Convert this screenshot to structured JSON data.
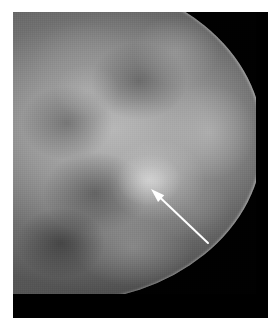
{
  "figure": {
    "modality": "mammogram",
    "view_label": "",
    "caption": "",
    "canvas": {
      "width": 280,
      "height": 332,
      "background_color": "#ffffff"
    },
    "image_area": {
      "x": 13,
      "y": 12,
      "width": 255,
      "height": 306,
      "background_color": "#000000"
    }
  },
  "scan": {
    "name": "breast-radiograph",
    "tissue_color": "#636363",
    "dense_tissue_color": "#c8c8c8",
    "fat_color": "#3a3a3a",
    "background_color": "#010101",
    "skin_line_color": "#d7d7d7",
    "orientation": "chest-wall-left"
  },
  "annotation": {
    "arrow": {
      "name": "lesion-pointer-arrow",
      "color": "#ffffff",
      "tip_x": 151,
      "tip_y": 189,
      "tail_x": 208,
      "tail_y": 243,
      "shaft_width": 2,
      "head_length": 14,
      "head_width": 9,
      "points_to": "suspicious-mass"
    },
    "lesion": {
      "name": "suspicious-mass",
      "center_x": 136,
      "center_y": 168,
      "radius_x": 32,
      "radius_y": 26
    }
  }
}
